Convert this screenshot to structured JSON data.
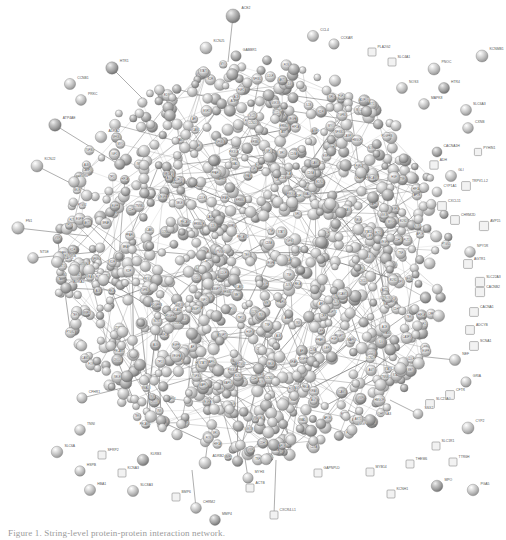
{
  "figure": {
    "kind": "protein-protein-interaction-network",
    "source_tool": "STRING",
    "background_color": "#ffffff",
    "node_fill": "#c9c9c9",
    "node_stroke": "#6e6e6e",
    "edge_color": "#707070",
    "label_color": "#3a3a3a",
    "caption": "Figure 1. String-level protein-protein interaction network.",
    "width": 506,
    "height": 540
  },
  "legend": {
    "node_meaning": "protein",
    "edge_meaning": "interaction",
    "sphere_node_meaning": "known 3D structure",
    "empty_node_meaning": "unknown 3D structure"
  },
  "chart_data": {
    "type": "network",
    "title": "Protein-protein interaction network",
    "layout": "force-directed hairball",
    "node_count_estimate": 1180,
    "edge_count_estimate": 2400,
    "core": {
      "center_x": 253,
      "center_y": 262,
      "radius_x": 196,
      "radius_y": 200,
      "density": "very high"
    },
    "peripheral_nodes": [
      {
        "label": "ACE2",
        "x": 233,
        "y": 16,
        "r": 7.0,
        "type": "sphere"
      },
      {
        "label": "CCL4",
        "x": 313,
        "y": 36,
        "r": 5.6,
        "type": "sphere"
      },
      {
        "label": "CCKAR",
        "x": 334,
        "y": 44,
        "r": 5.2,
        "type": "sphere"
      },
      {
        "label": "KCNJ5",
        "x": 206,
        "y": 48,
        "r": 6.0,
        "type": "sphere"
      },
      {
        "label": "GABBR1",
        "x": 236,
        "y": 56,
        "r": 5.2,
        "type": "sphere"
      },
      {
        "label": "PLA2G2",
        "x": 372,
        "y": 52,
        "r": 4.0,
        "type": "square"
      },
      {
        "label": "SLC4A1",
        "x": 392,
        "y": 62,
        "r": 4.0,
        "type": "square"
      },
      {
        "label": "KCNMB1",
        "x": 482,
        "y": 56,
        "r": 6.0,
        "type": "sphere"
      },
      {
        "label": "HTR1",
        "x": 112,
        "y": 68,
        "r": 6.2,
        "type": "sphere"
      },
      {
        "label": "PNOC",
        "x": 434,
        "y": 69,
        "r": 6.0,
        "type": "sphere"
      },
      {
        "label": "CCNB1",
        "x": 70,
        "y": 84,
        "r": 5.6,
        "type": "sphere"
      },
      {
        "label": "NOS3",
        "x": 402,
        "y": 88,
        "r": 5.5,
        "type": "sphere"
      },
      {
        "label": "HTR4",
        "x": 444,
        "y": 88,
        "r": 5.5,
        "type": "sphere"
      },
      {
        "label": "PRKC",
        "x": 81,
        "y": 100,
        "r": 5.4,
        "type": "sphere"
      },
      {
        "label": "MAPK8",
        "x": 424,
        "y": 104,
        "r": 5.4,
        "type": "sphere"
      },
      {
        "label": "SLC6A3",
        "x": 466,
        "y": 110,
        "r": 5.5,
        "type": "sphere"
      },
      {
        "label": "ATP4AE",
        "x": 55,
        "y": 125,
        "r": 6.2,
        "type": "sphere"
      },
      {
        "label": "CXNB",
        "x": 468,
        "y": 128,
        "r": 5.4,
        "type": "sphere"
      },
      {
        "label": "ADRA2",
        "x": 101,
        "y": 137,
        "r": 5.8,
        "type": "sphere"
      },
      {
        "label": "PYHIN1",
        "x": 478,
        "y": 152,
        "r": 3.6,
        "type": "square"
      },
      {
        "label": "CACNA1H",
        "x": 437,
        "y": 152,
        "r": 5.0,
        "type": "sphere"
      },
      {
        "label": "ADH",
        "x": 434,
        "y": 165,
        "r": 4.2,
        "type": "square"
      },
      {
        "label": "KCNJ2",
        "x": 37,
        "y": 166,
        "r": 6.0,
        "type": "sphere"
      },
      {
        "label": "GLI",
        "x": 451,
        "y": 176,
        "r": 5.6,
        "type": "sphere"
      },
      {
        "label": "TRPV1-L2",
        "x": 466,
        "y": 186,
        "r": 4.4,
        "type": "square"
      },
      {
        "label": "NR0",
        "x": 74,
        "y": 182,
        "r": 5.4,
        "type": "sphere"
      },
      {
        "label": "CYP1A1",
        "x": 437,
        "y": 192,
        "r": 5.0,
        "type": "sphere"
      },
      {
        "label": "CXCL11",
        "x": 442,
        "y": 206,
        "r": 4.4,
        "type": "square"
      },
      {
        "label": "CHRM2D",
        "x": 455,
        "y": 220,
        "r": 4.4,
        "type": "square"
      },
      {
        "label": "AVP15",
        "x": 484,
        "y": 226,
        "r": 4.6,
        "type": "square"
      },
      {
        "label": "FN1",
        "x": 18,
        "y": 228,
        "r": 6.2,
        "type": "sphere"
      },
      {
        "label": "NPY1R",
        "x": 470,
        "y": 252,
        "r": 5.4,
        "type": "sphere"
      },
      {
        "label": "AGTR1",
        "x": 468,
        "y": 264,
        "r": 4.4,
        "type": "square"
      },
      {
        "label": "NT5E",
        "x": 33,
        "y": 258,
        "r": 5.4,
        "type": "sphere"
      },
      {
        "label": "EDNRB",
        "x": 57,
        "y": 262,
        "r": 5.6,
        "type": "sphere"
      },
      {
        "label": "SLC22A3",
        "x": 480,
        "y": 282,
        "r": 4.6,
        "type": "square"
      },
      {
        "label": "CACNB2",
        "x": 480,
        "y": 292,
        "r": 4.6,
        "type": "square"
      },
      {
        "label": "TNF1",
        "x": 74,
        "y": 270,
        "r": 5.6,
        "type": "sphere"
      },
      {
        "label": "CACNA1",
        "x": 474,
        "y": 312,
        "r": 4.4,
        "type": "square"
      },
      {
        "label": "ADCYB",
        "x": 470,
        "y": 330,
        "r": 4.4,
        "type": "square"
      },
      {
        "label": "ADRA1",
        "x": 66,
        "y": 288,
        "r": 5.4,
        "type": "sphere"
      },
      {
        "label": "SCNA1",
        "x": 474,
        "y": 346,
        "r": 4.4,
        "type": "square"
      },
      {
        "label": "NEF",
        "x": 455,
        "y": 360,
        "r": 5.6,
        "type": "sphere"
      },
      {
        "label": "GRIA",
        "x": 466,
        "y": 382,
        "r": 5.2,
        "type": "sphere"
      },
      {
        "label": "CFTR",
        "x": 450,
        "y": 395,
        "r": 4.4,
        "type": "square"
      },
      {
        "label": "SLC23A0",
        "x": 430,
        "y": 404,
        "r": 4.4,
        "type": "square"
      },
      {
        "label": "SSX2",
        "x": 418,
        "y": 414,
        "r": 5.0,
        "type": "sphere"
      },
      {
        "label": "CFHR1",
        "x": 82,
        "y": 398,
        "r": 5.2,
        "type": "sphere"
      },
      {
        "label": "CHRNA3",
        "x": 370,
        "y": 420,
        "r": 5.6,
        "type": "sphere"
      },
      {
        "label": "MGP",
        "x": 352,
        "y": 430,
        "r": 5.2,
        "type": "sphere"
      },
      {
        "label": "TNNI",
        "x": 80,
        "y": 430,
        "r": 5.4,
        "type": "sphere"
      },
      {
        "label": "CYP2",
        "x": 468,
        "y": 428,
        "r": 6.0,
        "type": "sphere"
      },
      {
        "label": "SLC1R1",
        "x": 436,
        "y": 446,
        "r": 4.0,
        "type": "square"
      },
      {
        "label": "SLC6A",
        "x": 57,
        "y": 452,
        "r": 5.8,
        "type": "sphere"
      },
      {
        "label": "SFRP2",
        "x": 102,
        "y": 455,
        "r": 4.0,
        "type": "square"
      },
      {
        "label": "THEM6",
        "x": 410,
        "y": 464,
        "r": 4.0,
        "type": "square"
      },
      {
        "label": "TTR6H",
        "x": 453,
        "y": 462,
        "r": 4.0,
        "type": "square"
      },
      {
        "label": "HSPB",
        "x": 80,
        "y": 471,
        "r": 5.2,
        "type": "sphere"
      },
      {
        "label": "MYB14",
        "x": 370,
        "y": 472,
        "r": 4.0,
        "type": "square"
      },
      {
        "label": "KCNA3",
        "x": 122,
        "y": 473,
        "r": 4.0,
        "type": "square"
      },
      {
        "label": "KLRB3",
        "x": 143,
        "y": 460,
        "r": 5.8,
        "type": "sphere"
      },
      {
        "label": "ADRB2",
        "x": 205,
        "y": 463,
        "r": 6.0,
        "type": "sphere"
      },
      {
        "label": "GAPNPLD",
        "x": 318,
        "y": 473,
        "r": 4.0,
        "type": "square"
      },
      {
        "label": "MYH3",
        "x": 248,
        "y": 478,
        "r": 5.2,
        "type": "sphere"
      },
      {
        "label": "ACTB",
        "x": 250,
        "y": 488,
        "r": 4.0,
        "type": "square"
      },
      {
        "label": "HBA1",
        "x": 90,
        "y": 490,
        "r": 5.6,
        "type": "sphere"
      },
      {
        "label": "SLC8A3",
        "x": 133,
        "y": 491,
        "r": 5.6,
        "type": "sphere"
      },
      {
        "label": "BMP6",
        "x": 176,
        "y": 497,
        "r": 4.0,
        "type": "square"
      },
      {
        "label": "MPO",
        "x": 437,
        "y": 486,
        "r": 5.8,
        "type": "sphere"
      },
      {
        "label": "PGA5",
        "x": 473,
        "y": 490,
        "r": 5.8,
        "type": "sphere"
      },
      {
        "label": "KCNH1",
        "x": 391,
        "y": 494,
        "r": 4.0,
        "type": "square"
      },
      {
        "label": "CHRM2",
        "x": 196,
        "y": 508,
        "r": 5.4,
        "type": "sphere"
      },
      {
        "label": "MMP4",
        "x": 215,
        "y": 520,
        "r": 5.4,
        "type": "sphere"
      },
      {
        "label": "CXCR4-L1",
        "x": 274,
        "y": 515,
        "r": 4.0,
        "type": "square"
      }
    ],
    "peripheral_edges": [
      {
        "from": "ACE2",
        "to_core_x": 228,
        "to_core_y": 62
      },
      {
        "from": "HTR1",
        "to_core_x": 146,
        "to_core_y": 102
      },
      {
        "from": "ATP4AE",
        "to_core_x": 118,
        "to_core_y": 164
      },
      {
        "from": "KCNJ2",
        "to_core_x": 96,
        "to_core_y": 196
      },
      {
        "from": "FN1",
        "to_core_x": 88,
        "to_core_y": 236
      },
      {
        "from": "NT5E",
        "to_core_x": 96,
        "to_core_y": 252
      },
      {
        "from": "EDNRB",
        "to_core_x": 100,
        "to_core_y": 258
      },
      {
        "from": "TNF1",
        "to_core_x": 112,
        "to_core_y": 272
      },
      {
        "from": "ADRA1",
        "to_core_x": 108,
        "to_core_y": 290
      },
      {
        "from": "NEF",
        "to_core_x": 418,
        "to_core_y": 356
      },
      {
        "from": "SSX2",
        "to_core_x": 390,
        "to_core_y": 400
      },
      {
        "from": "CFHR1",
        "to_core_x": 122,
        "to_core_y": 388
      },
      {
        "from": "CHRNA3",
        "to_core_x": 348,
        "to_core_y": 410
      },
      {
        "from": "ADRB2",
        "to_core_x": 208,
        "to_core_y": 440
      },
      {
        "from": "MYH3",
        "to_core_x": 244,
        "to_core_y": 452
      },
      {
        "from": "CHRM2",
        "to_core_x": 192,
        "to_core_y": 470
      },
      {
        "from": "CXCR4-L1",
        "to_core_x": 276,
        "to_core_y": 460
      }
    ],
    "core_labels": [
      "CCL4",
      "CD8A",
      "IL6",
      "TNF",
      "ALB",
      "EGFR",
      "AKT1",
      "STAT3",
      "JUN",
      "FOS",
      "MYC",
      "TP53",
      "VEGFA",
      "MAPK1",
      "MAPK3",
      "PIK3CA",
      "SRC",
      "CASP3",
      "CXCL8",
      "IL1B",
      "PTGS2",
      "MMP9",
      "CCND1",
      "ESR1",
      "AR",
      "INS",
      "IGF1",
      "HIF1A",
      "NFKB1",
      "RELA",
      "CTNNB1",
      "GSK3B",
      "SMAD3",
      "TGFB1",
      "PPARG",
      "LEP",
      "ADIPOQ",
      "CRP",
      "APOE",
      "LDLR",
      "HMGCR",
      "ACE",
      "AGT",
      "NOS3",
      "EDN1",
      "VWF",
      "SELE",
      "ICAM1",
      "VCAM1",
      "PECAM1",
      "CDH5",
      "KDR",
      "FLT1",
      "ANGPT1",
      "TEK",
      "PDGFRB",
      "FGF2",
      "HGF",
      "MET",
      "ERBB2",
      "KRAS",
      "BRAF"
    ]
  }
}
